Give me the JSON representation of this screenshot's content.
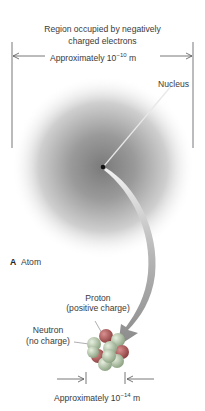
{
  "figure": {
    "panel_letter": "A",
    "panel_title": "Atom",
    "electron_region": {
      "label_line1": "Region occupied by negatively",
      "label_line2": "charged electrons",
      "size_prefix": "Approximately 10",
      "size_exponent": "−10",
      "size_unit": " m"
    },
    "nucleus_label": "Nucleus",
    "proton": {
      "label": "Proton",
      "detail": "(positive charge)"
    },
    "neutron": {
      "label": "Neutron",
      "detail": "(no charge)"
    },
    "nucleus_size": {
      "size_prefix": "Approximately 10",
      "size_exponent": "−14",
      "size_unit": " m"
    },
    "colors": {
      "cloud_center": "#8a8a8a",
      "arrow": "#8c8c8c",
      "proton": "#b85a5a",
      "neutron": "#a8c0a0",
      "text": "#3a3a3a"
    }
  }
}
